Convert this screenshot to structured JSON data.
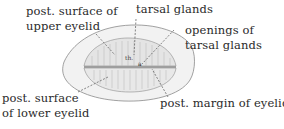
{
  "diagram": {
    "labels": {
      "post_surface_upper_eyelid": [
        "post. surface of",
        "upper eyelid"
      ],
      "tarsal_glands": "tarsal glands",
      "openings_tarsal_glands": [
        "openings of",
        "tarsal glands"
      ],
      "post_surface_lower_eyelid": [
        "post. surface",
        "of lower eyelid"
      ],
      "post_margin_eyelid": "post. margin of eyelid"
    },
    "in_figure_marks": [
      "th.",
      "a"
    ],
    "colors": {
      "text": "#2a2a2a",
      "line": "#555555",
      "shading": "#bdbdbd",
      "background": "#ffffff"
    }
  }
}
